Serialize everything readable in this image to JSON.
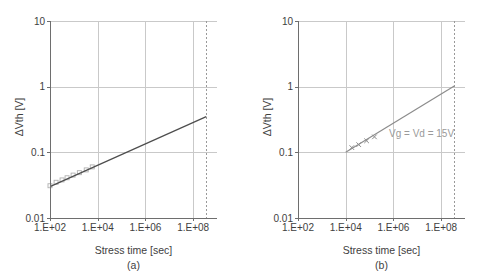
{
  "figure": {
    "background": "#ffffff",
    "colors": {
      "axis": "#6e6e6e",
      "grid": "#c9c9c9",
      "tick_text": "#3e3e3e",
      "annotation_text": "#9a9a9a"
    }
  },
  "chart_data": [
    {
      "id": "a",
      "type": "scatter",
      "caption": "(a)",
      "xlabel": "Stress time [sec]",
      "ylabel": "ΔVth [V]",
      "xscale": "log",
      "yscale": "log",
      "xlim": [
        100,
        1000000000
      ],
      "ylim": [
        0.01,
        10
      ],
      "xticks": [
        100,
        10000,
        1000000,
        100000000
      ],
      "xtick_labels": [
        "1.E+02",
        "1.E+04",
        "1.E+06",
        "1.E+08"
      ],
      "yticks": [
        0.01,
        0.1,
        1,
        10
      ],
      "ytick_labels": [
        "0.01",
        "0.1",
        "1",
        "10"
      ],
      "grid_x": [
        10000,
        1000000,
        100000000
      ],
      "grid_y": [
        0.1,
        1,
        10
      ],
      "series": [
        {
          "name": "measured-points",
          "type": "scatter",
          "marker": "open-square",
          "color": "#b0b0b0",
          "x": [
            100,
            180,
            320,
            520,
            930,
            1700,
            3300,
            5900
          ],
          "y": [
            0.031,
            0.035,
            0.038,
            0.041,
            0.045,
            0.049,
            0.054,
            0.06
          ]
        },
        {
          "name": "extrapolation-line",
          "type": "line",
          "color": "#4d4d4d",
          "x": [
            100,
            355000000
          ],
          "y": [
            0.03,
            0.35
          ]
        }
      ],
      "ref_line": {
        "x": 355000000,
        "style": "dashed",
        "color": "#999999"
      },
      "annotation": ""
    },
    {
      "id": "b",
      "type": "scatter",
      "caption": "(b)",
      "xlabel": "Stress time [sec]",
      "ylabel": "ΔVth [V]",
      "xscale": "log",
      "yscale": "log",
      "xlim": [
        100,
        1000000000
      ],
      "ylim": [
        0.01,
        10
      ],
      "xticks": [
        100,
        10000,
        1000000,
        100000000
      ],
      "xtick_labels": [
        "1.E+02",
        "1.E+04",
        "1.E+06",
        "1.E+08"
      ],
      "yticks": [
        0.01,
        0.1,
        1,
        10
      ],
      "ytick_labels": [
        "0.01",
        "0.1",
        "1",
        "10"
      ],
      "grid_x": [
        10000,
        1000000,
        100000000
      ],
      "grid_y": [
        0.1,
        1,
        10
      ],
      "series": [
        {
          "name": "measured-points",
          "type": "scatter",
          "marker": "x-cross",
          "color": "#8c8c8c",
          "x": [
            18000,
            35000,
            75000,
            160000
          ],
          "y": [
            0.118,
            0.131,
            0.15,
            0.172
          ]
        },
        {
          "name": "extrapolation-line",
          "type": "line",
          "color": "#8c8c8c",
          "x": [
            10000,
            355000000
          ],
          "y": [
            0.1,
            1.02
          ]
        }
      ],
      "ref_line": {
        "x": 355000000,
        "style": "dashed",
        "color": "#999999"
      },
      "annotation": "Vg = Vd = 15V"
    }
  ]
}
